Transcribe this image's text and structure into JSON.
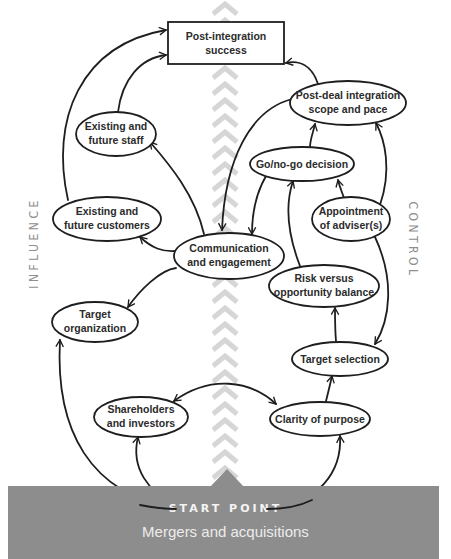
{
  "diagram": {
    "side_labels": {
      "left": "INFLUENCE",
      "right": "CONTROL"
    },
    "start": {
      "title": "START POINT",
      "subtitle": "Mergers and acquisitions"
    },
    "nodes": {
      "post_integration_success": [
        "Post-integration",
        "success"
      ],
      "post_deal_integration": [
        "Post-deal integration",
        "scope and pace"
      ],
      "existing_staff": [
        "Existing and",
        "future staff"
      ],
      "go_no_go": [
        "Go/no-go decision"
      ],
      "existing_customers": [
        "Existing and",
        "future customers"
      ],
      "appointment_advisers": [
        "Appointment",
        "of adviser(s)"
      ],
      "communication": [
        "Communication",
        "and engagement"
      ],
      "risk_opportunity": [
        "Risk versus",
        "opportunity balance"
      ],
      "target_organization": [
        "Target",
        "organization"
      ],
      "target_selection": [
        "Target selection"
      ],
      "shareholders": [
        "Shareholders",
        "and investors"
      ],
      "clarity_purpose": [
        "Clarity of purpose"
      ]
    },
    "edges": [
      {
        "from": "existing_customers",
        "to": "post_integration_success"
      },
      {
        "from": "existing_staff",
        "to": "post_integration_success"
      },
      {
        "from": "post_deal_integration",
        "to": "post_integration_success"
      },
      {
        "from": "post_deal_integration",
        "to": "communication"
      },
      {
        "from": "go_no_go",
        "to": "post_deal_integration"
      },
      {
        "from": "appointment_advisers",
        "to": "post_deal_integration"
      },
      {
        "from": "appointment_advisers",
        "to": "go_no_go"
      },
      {
        "from": "risk_opportunity",
        "to": "go_no_go"
      },
      {
        "from": "go_no_go",
        "to": "communication"
      },
      {
        "from": "communication",
        "to": "existing_staff"
      },
      {
        "from": "communication",
        "to": "existing_customers"
      },
      {
        "from": "communication",
        "to": "target_organization"
      },
      {
        "from": "appointment_advisers",
        "to": "target_selection"
      },
      {
        "from": "target_selection",
        "to": "risk_opportunity"
      },
      {
        "from": "clarity_purpose",
        "to": "target_selection"
      },
      {
        "from": "shareholders",
        "to": "clarity_purpose",
        "bidirectional": true
      },
      {
        "from": "start",
        "to": "target_organization"
      },
      {
        "from": "start",
        "to": "shareholders"
      },
      {
        "from": "start",
        "to": "clarity_purpose"
      }
    ],
    "colors": {
      "stroke": "#1e1e1e",
      "chevron": "#d6d6d6",
      "start_band": "#8d8d8d",
      "side_label": "#8e8e8e"
    }
  }
}
